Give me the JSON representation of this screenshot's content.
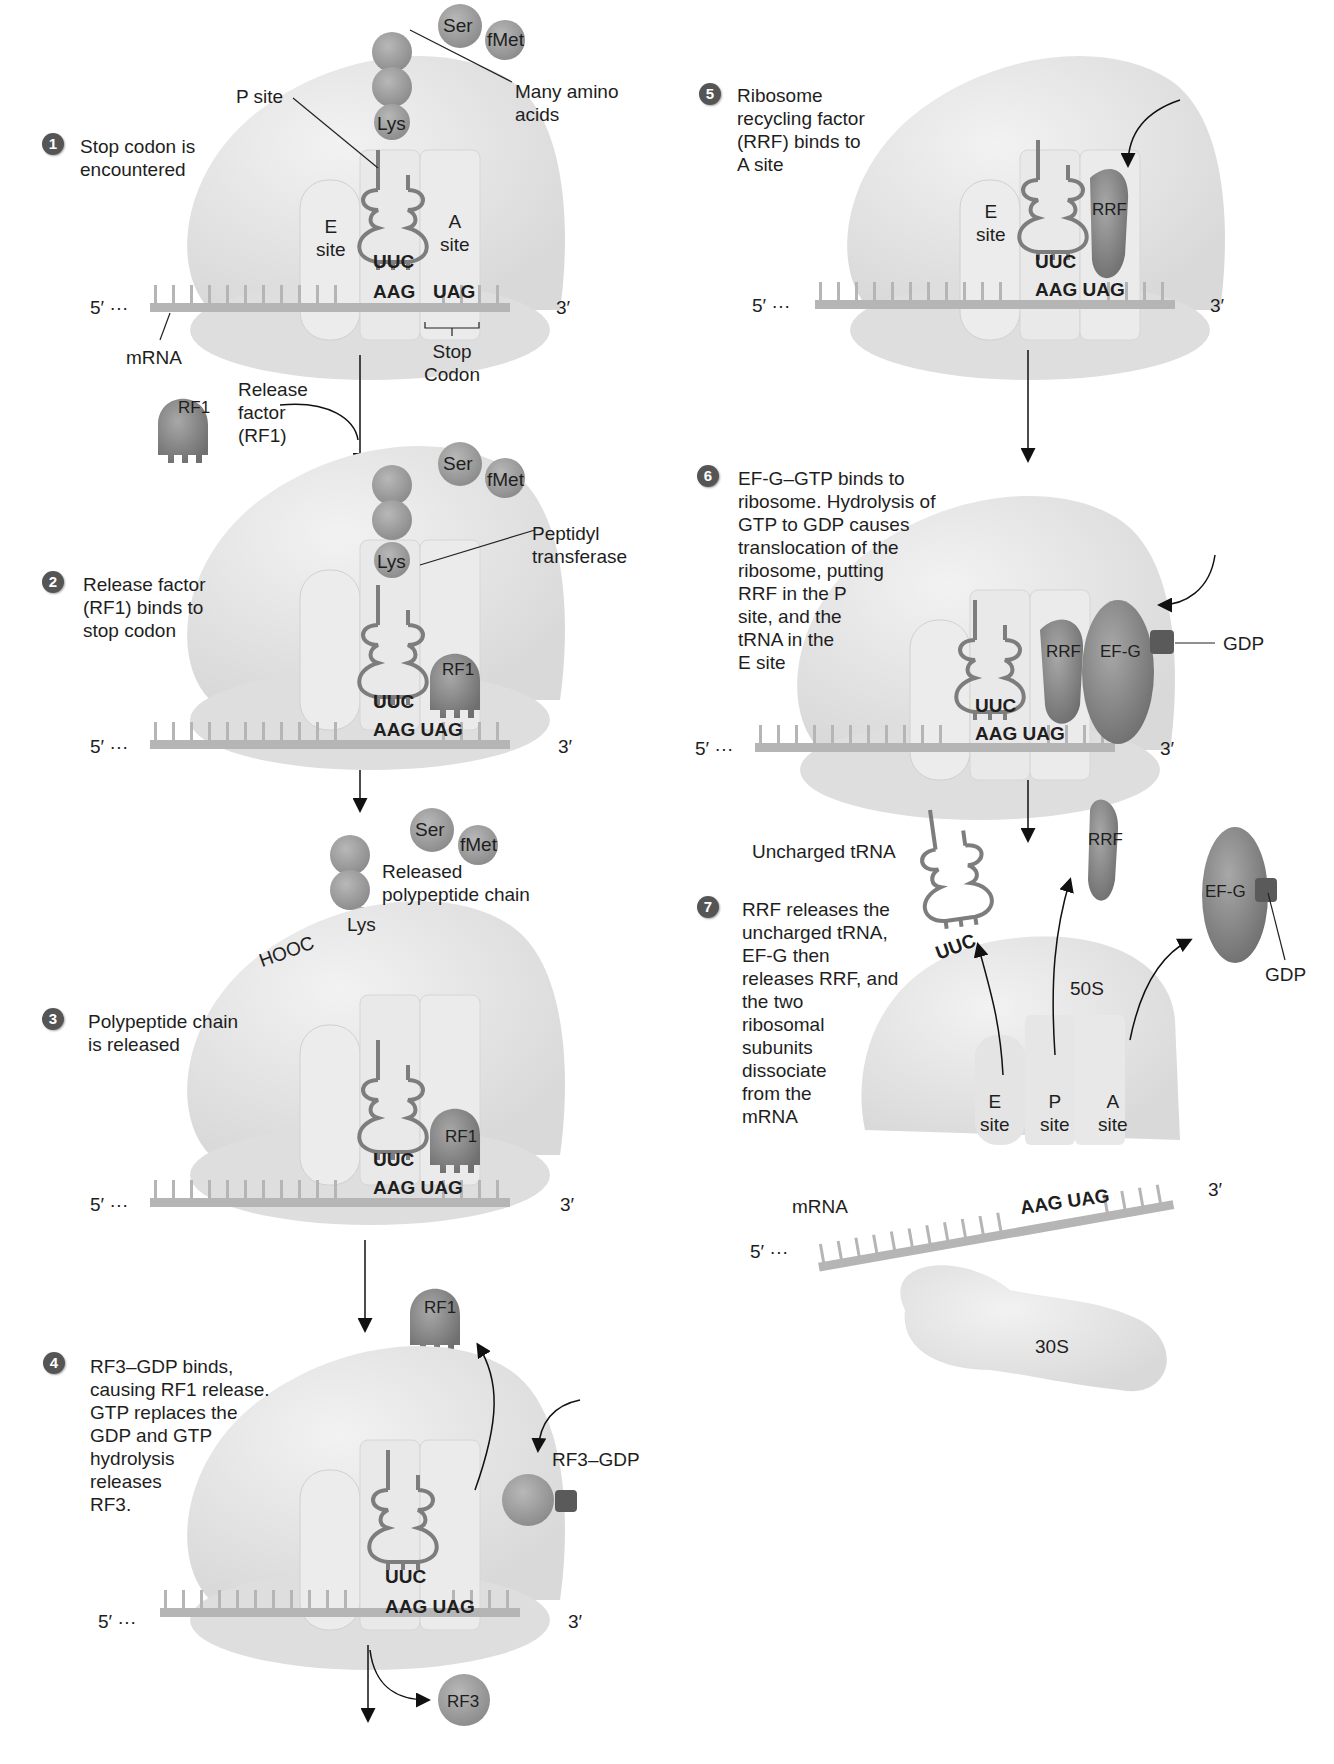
{
  "steps": [
    {
      "number": "1",
      "text": "Stop codon is\nencountered"
    },
    {
      "number": "2",
      "text": "Release factor\n(RF1) binds to\nstop codon"
    },
    {
      "number": "3",
      "text": "Polypeptide chain\nis released"
    },
    {
      "number": "4",
      "text": "RF3–GDP binds,\ncausing RF1 release.\nGTP replaces the\nGDP and GTP\nhydrolysis\nreleases\nRF3."
    },
    {
      "number": "5",
      "text": "Ribosome\nrecycling factor\n(RRF) binds to\nA site"
    },
    {
      "number": "6",
      "text": "EF-G–GTP binds to\nribosome. Hydrolysis of\nGTP to GDP causes\ntranslocation of the\nribosome, putting\nRRF in the P\nsite, and the\ntRNA  in the\nE site"
    },
    {
      "number": "7",
      "text": "RRF releases the\nuncharged tRNA,\nEF-G then\nreleases RRF, and\nthe two\nribosomal\nsubunits\ndissociate\nfrom the\nmRNA"
    }
  ],
  "labels": {
    "p_site": "P site",
    "many_amino_acids": "Many amino\nacids",
    "e_site": "E\nsite",
    "a_site": "A\nsite",
    "p_site_short": "P\nsite",
    "mrna": "mRNA",
    "stop_codon": "Stop\nCodon",
    "release_factor": "Release\nfactor\n(RF1)",
    "peptidyl_transferase": "Peptidyl\ntransferase",
    "released_chain": "Released\npolypeptide chain",
    "hooc": "HOOC",
    "rf3_gdp": "RF3–GDP",
    "gdp": "GDP",
    "uncharged_trna": "Uncharged tRNA",
    "s50": "50S",
    "s30": "30S",
    "five_prime": "5′ ···",
    "three_prime": "3′"
  },
  "molecules": {
    "ser": "Ser",
    "fmet": "fMet",
    "lys": "Lys",
    "rf1": "RF1",
    "rf3": "RF3",
    "rrf": "RRF",
    "efg": "EF-G",
    "anticodon": "UUC",
    "codon_p": "AAG",
    "codon_a": "UAG",
    "codon_pair": "AAG UAG"
  },
  "colors": {
    "ribosome": "#e6e6e6",
    "mrna": "#b5b5b5",
    "factor": "#8a8a8a",
    "gdp": "#5a5a5a",
    "step_badge": "#555555"
  }
}
